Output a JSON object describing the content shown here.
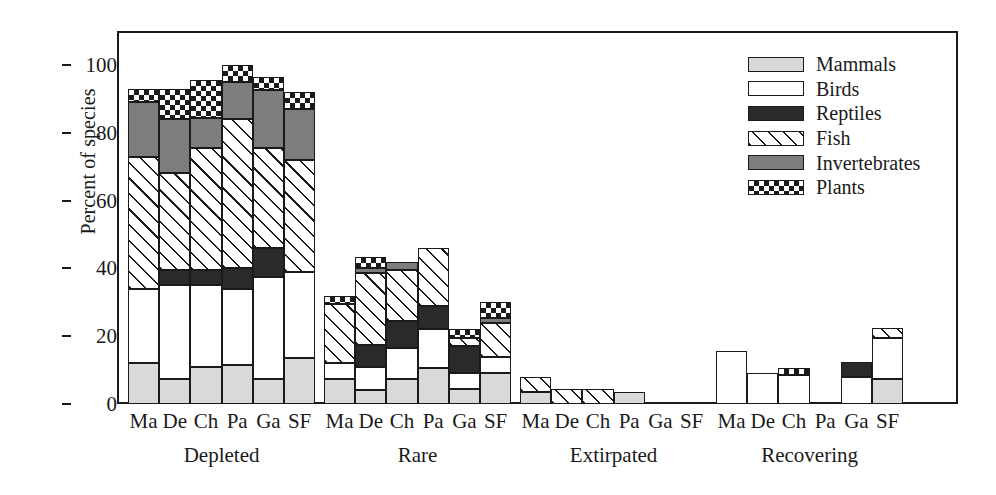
{
  "chart_data": {
    "type": "bar",
    "subtype": "stacked-bar-grouped",
    "title": "",
    "xlabel": "",
    "ylabel": "Percent of species",
    "ylim": [
      0,
      108
    ],
    "yticks": [
      0,
      20,
      40,
      60,
      80,
      100
    ],
    "ytick_labels": [
      "0",
      "20",
      "40",
      "60",
      "80",
      "100"
    ],
    "grid": false,
    "legend_position": "top-right",
    "categories": [
      "Ma",
      "De",
      "Ch",
      "Pa",
      "Ga",
      "SF"
    ],
    "groups": [
      "Depleted",
      "Rare",
      "Extirpated",
      "Recovering"
    ],
    "series_names": [
      "Mammals",
      "Birds",
      "Reptiles",
      "Fish",
      "Invertebrates",
      "Plants"
    ],
    "series_patterns": [
      "light-gray-solid",
      "white-solid",
      "black-solid",
      "diagonal-hatch",
      "dark-gray-solid",
      "checkerboard"
    ],
    "data": {
      "Depleted": {
        "Ma": {
          "Mammals": 12,
          "Birds": 22,
          "Reptiles": 0,
          "Fish": 39,
          "Invertebrates": 16,
          "Plants": 4
        },
        "De": {
          "Mammals": 7.5,
          "Birds": 27.5,
          "Reptiles": 4.5,
          "Fish": 28.5,
          "Invertebrates": 16,
          "Plants": 9
        },
        "Ch": {
          "Mammals": 11,
          "Birds": 24,
          "Reptiles": 4.5,
          "Fish": 36,
          "Invertebrates": 9,
          "Plants": 11
        },
        "Pa": {
          "Mammals": 11.5,
          "Birds": 22.5,
          "Reptiles": 6,
          "Fish": 44,
          "Invertebrates": 11,
          "Plants": 5
        },
        "Ga": {
          "Mammals": 7.5,
          "Birds": 30,
          "Reptiles": 8.5,
          "Fish": 29.5,
          "Invertebrates": 17,
          "Plants": 4
        },
        "SF": {
          "Mammals": 13.5,
          "Birds": 25.5,
          "Reptiles": 0,
          "Fish": 33,
          "Invertebrates": 15,
          "Plants": 5
        }
      },
      "Rare": {
        "Ma": {
          "Mammals": 7.5,
          "Birds": 4.5,
          "Reptiles": 0,
          "Fish": 17.5,
          "Invertebrates": 0,
          "Plants": 2.5
        },
        "De": {
          "Mammals": 4,
          "Birds": 7,
          "Reptiles": 6.5,
          "Fish": 21,
          "Invertebrates": 1.5,
          "Plants": 3.5
        },
        "Ch": {
          "Mammals": 7.5,
          "Birds": 9,
          "Reptiles": 8,
          "Fish": 15,
          "Invertebrates": 2.5,
          "Plants": 0
        },
        "Pa": {
          "Mammals": 10.5,
          "Birds": 11.5,
          "Reptiles": 7,
          "Fish": 17,
          "Invertebrates": 0,
          "Plants": 0
        },
        "Ga": {
          "Mammals": 4.5,
          "Birds": 4.5,
          "Reptiles": 8,
          "Fish": 2.5,
          "Invertebrates": 0,
          "Plants": 2.5
        },
        "SF": {
          "Mammals": 9,
          "Birds": 5,
          "Reptiles": 0,
          "Fish": 10,
          "Invertebrates": 1.5,
          "Plants": 4.5
        }
      },
      "Extirpated": {
        "Ma": {
          "Mammals": 3.5,
          "Birds": 0,
          "Reptiles": 0,
          "Fish": 4.5,
          "Invertebrates": 0,
          "Plants": 0
        },
        "De": {
          "Mammals": 0,
          "Birds": 0,
          "Reptiles": 0,
          "Fish": 4.5,
          "Invertebrates": 0,
          "Plants": 0
        },
        "Ch": {
          "Mammals": 0,
          "Birds": 0,
          "Reptiles": 0,
          "Fish": 4.5,
          "Invertebrates": 0,
          "Plants": 0
        },
        "Pa": {
          "Mammals": 3.5,
          "Birds": 0,
          "Reptiles": 0,
          "Fish": 0,
          "Invertebrates": 0,
          "Plants": 0
        },
        "Ga": {
          "Mammals": 0,
          "Birds": 0,
          "Reptiles": 0,
          "Fish": 0,
          "Invertebrates": 0,
          "Plants": 0
        },
        "SF": {
          "Mammals": 0,
          "Birds": 0,
          "Reptiles": 0,
          "Fish": 0,
          "Invertebrates": 0,
          "Plants": 0
        }
      },
      "Recovering": {
        "Ma": {
          "Mammals": 0,
          "Birds": 15.5,
          "Reptiles": 0,
          "Fish": 0,
          "Invertebrates": 0,
          "Plants": 0
        },
        "De": {
          "Mammals": 0,
          "Birds": 9,
          "Reptiles": 0,
          "Fish": 0,
          "Invertebrates": 0,
          "Plants": 0
        },
        "Ch": {
          "Mammals": 0,
          "Birds": 8.5,
          "Reptiles": 0,
          "Fish": 0,
          "Invertebrates": 0,
          "Plants": 2
        },
        "Pa": {
          "Mammals": 0,
          "Birds": 0,
          "Reptiles": 0,
          "Fish": 0,
          "Invertebrates": 0,
          "Plants": 0
        },
        "Ga": {
          "Mammals": 0,
          "Birds": 8,
          "Reptiles": 4.5,
          "Fish": 0,
          "Invertebrates": 0,
          "Plants": 0
        },
        "SF": {
          "Mammals": 7.5,
          "Birds": 12,
          "Reptiles": 0,
          "Fish": 3,
          "Invertebrates": 0,
          "Plants": 0
        }
      }
    }
  },
  "legend": {
    "items": [
      {
        "label": "Mammals",
        "key": "Mammals"
      },
      {
        "label": "Birds",
        "key": "Birds"
      },
      {
        "label": "Reptiles",
        "key": "Reptiles"
      },
      {
        "label": "Fish",
        "key": "Fish"
      },
      {
        "label": "Invertebrates",
        "key": "Invertebrates"
      },
      {
        "label": "Plants",
        "key": "Plants"
      }
    ]
  },
  "colors": {
    "axis": "#1a1a1a",
    "mammals": "#d9d9d9",
    "birds": "#ffffff",
    "reptiles": "#2a2a2a",
    "fish": "#ffffff",
    "invertebrates": "#7d7d7d",
    "plants": "#ffffff"
  }
}
